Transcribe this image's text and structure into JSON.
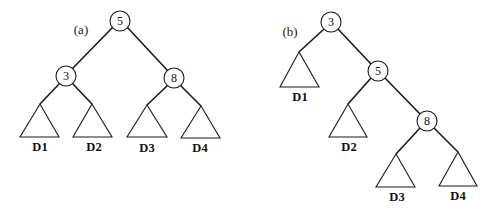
{
  "figure": {
    "panels": [
      {
        "id": "a",
        "label": "(a)",
        "root": "5",
        "nodes": [
          {
            "key": "5",
            "left": "3",
            "right": "8"
          },
          {
            "key": "3",
            "left": "D1",
            "right": "D2"
          },
          {
            "key": "8",
            "left": "D3",
            "right": "D4"
          }
        ],
        "subtrees": [
          "D1",
          "D2",
          "D3",
          "D4"
        ]
      },
      {
        "id": "b",
        "label": "(b)",
        "root": "3",
        "nodes": [
          {
            "key": "3",
            "left": "D1",
            "right": "5"
          },
          {
            "key": "5",
            "left": "D2",
            "right": "8"
          },
          {
            "key": "8",
            "left": "D3",
            "right": "D4"
          }
        ],
        "subtrees": [
          "D1",
          "D2",
          "D3",
          "D4"
        ]
      }
    ]
  },
  "colors": {
    "stroke": "#1a1a1a",
    "background": "#ffffff"
  }
}
